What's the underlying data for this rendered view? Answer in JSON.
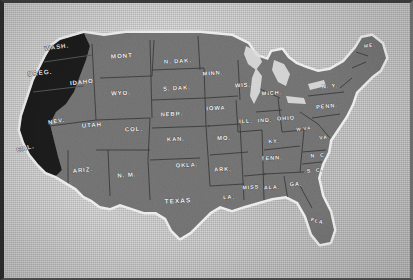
{
  "image": {
    "kind": "printed-halftone-map",
    "subject": "Map of the United States",
    "background_color": "#c8c8c8",
    "land_color": "#787878",
    "highlight_color": "#1e1e1e",
    "coast_halo_color": "#e9e9e9",
    "border_color": "#2a2a2a",
    "label_color": "#f2f2f2"
  },
  "map": {
    "highlighted_states": [
      "WASH.",
      "OREG.",
      "CAL."
    ],
    "states": [
      {
        "abbr": "WASH.",
        "x": 57,
        "y": 49,
        "size": 6.2,
        "rot": -8,
        "dark": true
      },
      {
        "abbr": "OREG.",
        "x": 40,
        "y": 75,
        "size": 6.4,
        "rot": -6,
        "dark": true
      },
      {
        "abbr": "CAL.",
        "x": 26,
        "y": 150,
        "size": 6.4,
        "rot": -14,
        "dark": true
      },
      {
        "abbr": "IDAHO",
        "x": 82,
        "y": 84,
        "size": 6.0,
        "rot": -6,
        "dark": false
      },
      {
        "abbr": "MONT",
        "x": 122,
        "y": 58,
        "size": 6.2,
        "rot": -4,
        "dark": false
      },
      {
        "abbr": "N. DAK.",
        "x": 178,
        "y": 63,
        "size": 5.8,
        "rot": -3,
        "dark": false
      },
      {
        "abbr": "S. DAK.",
        "x": 177,
        "y": 90,
        "size": 5.8,
        "rot": -3,
        "dark": false
      },
      {
        "abbr": "WYO.",
        "x": 121,
        "y": 95,
        "size": 6.0,
        "rot": -3,
        "dark": false
      },
      {
        "abbr": "NEBR.",
        "x": 172,
        "y": 116,
        "size": 5.8,
        "rot": -3,
        "dark": false
      },
      {
        "abbr": "NEV.",
        "x": 57,
        "y": 123,
        "size": 6.0,
        "rot": -10,
        "dark": false
      },
      {
        "abbr": "UTAH",
        "x": 92,
        "y": 127,
        "size": 6.0,
        "rot": -4,
        "dark": false
      },
      {
        "abbr": "COL.",
        "x": 134,
        "y": 131,
        "size": 6.0,
        "rot": -3,
        "dark": false
      },
      {
        "abbr": "ARIZ.",
        "x": 83,
        "y": 172,
        "size": 6.0,
        "rot": -6,
        "dark": false
      },
      {
        "abbr": "N. M.",
        "x": 127,
        "y": 177,
        "size": 6.0,
        "rot": -4,
        "dark": false
      },
      {
        "abbr": "KAN.",
        "x": 176,
        "y": 141,
        "size": 5.8,
        "rot": -3,
        "dark": false
      },
      {
        "abbr": "OKLA.",
        "x": 187,
        "y": 167,
        "size": 5.8,
        "rot": -3,
        "dark": false
      },
      {
        "abbr": "TEXAS",
        "x": 178,
        "y": 203,
        "size": 6.6,
        "rot": -3,
        "dark": false
      },
      {
        "abbr": "MINN.",
        "x": 213,
        "y": 75,
        "size": 5.6,
        "rot": -4,
        "dark": false
      },
      {
        "abbr": "IOWA",
        "x": 216,
        "y": 110,
        "size": 5.8,
        "rot": -3,
        "dark": false
      },
      {
        "abbr": "MO.",
        "x": 224,
        "y": 140,
        "size": 5.8,
        "rot": -3,
        "dark": false
      },
      {
        "abbr": "ARK.",
        "x": 223,
        "y": 171,
        "size": 5.6,
        "rot": -3,
        "dark": false
      },
      {
        "abbr": "LA.",
        "x": 229,
        "y": 199,
        "size": 5.6,
        "rot": -3,
        "dark": false
      },
      {
        "abbr": "WIS.",
        "x": 243,
        "y": 87,
        "size": 5.8,
        "rot": -3,
        "dark": false
      },
      {
        "abbr": "ILL.",
        "x": 246,
        "y": 123,
        "size": 5.6,
        "rot": -3,
        "dark": false
      },
      {
        "abbr": "IND.",
        "x": 265,
        "y": 122,
        "size": 5.4,
        "rot": -3,
        "dark": false
      },
      {
        "abbr": "MICH.",
        "x": 272,
        "y": 95,
        "size": 5.6,
        "rot": -3,
        "dark": false
      },
      {
        "abbr": "OHIO",
        "x": 286,
        "y": 120,
        "size": 5.6,
        "rot": -3,
        "dark": false
      },
      {
        "abbr": "KY.",
        "x": 274,
        "y": 143,
        "size": 5.4,
        "rot": -3,
        "dark": false
      },
      {
        "abbr": "TENN.",
        "x": 272,
        "y": 160,
        "size": 5.6,
        "rot": -3,
        "dark": false
      },
      {
        "abbr": "MISS.",
        "x": 252,
        "y": 189,
        "size": 5.4,
        "rot": -3,
        "dark": false
      },
      {
        "abbr": "ALA.",
        "x": 272,
        "y": 189,
        "size": 5.4,
        "rot": -3,
        "dark": false
      },
      {
        "abbr": "GA.",
        "x": 296,
        "y": 186,
        "size": 5.6,
        "rot": -3,
        "dark": false
      },
      {
        "abbr": "FLA.",
        "x": 318,
        "y": 223,
        "size": 5.4,
        "rot": 14,
        "dark": false
      },
      {
        "abbr": "S. C.",
        "x": 315,
        "y": 172,
        "size": 5.2,
        "rot": -6,
        "dark": false
      },
      {
        "abbr": "N. C.",
        "x": 319,
        "y": 157,
        "size": 5.2,
        "rot": -6,
        "dark": false
      },
      {
        "abbr": "VA.",
        "x": 325,
        "y": 139,
        "size": 5.2,
        "rot": -8,
        "dark": false
      },
      {
        "abbr": "W.VA.",
        "x": 305,
        "y": 130,
        "size": 4.6,
        "rot": -6,
        "dark": false
      },
      {
        "abbr": "PENN.",
        "x": 327,
        "y": 108,
        "size": 5.6,
        "rot": -5,
        "dark": false
      },
      {
        "abbr": "N. Y.",
        "x": 330,
        "y": 88,
        "size": 5.6,
        "rot": -6,
        "dark": false
      },
      {
        "abbr": "ME.",
        "x": 370,
        "y": 47,
        "size": 5.0,
        "rot": -10,
        "dark": false
      }
    ]
  }
}
